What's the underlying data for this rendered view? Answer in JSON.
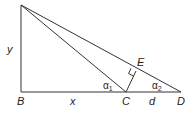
{
  "diagram": {
    "type": "geometry",
    "points": {
      "A": {
        "x": 21,
        "y": 5,
        "label": ""
      },
      "B": {
        "x": 21,
        "y": 92,
        "label": "B"
      },
      "C": {
        "x": 126,
        "y": 92,
        "label": "C"
      },
      "D": {
        "x": 181,
        "y": 92,
        "label": "D"
      },
      "E": {
        "x": 136,
        "y": 71,
        "label": "E"
      }
    },
    "labels": {
      "y": "y",
      "x": "x",
      "d": "d",
      "B": "B",
      "C": "C",
      "D": "D",
      "E": "E",
      "alpha1": "α",
      "alpha1_sub": "1",
      "alpha2": "α",
      "alpha2_sub": "2"
    },
    "segments": [
      "AB",
      "BD",
      "AC",
      "AD",
      "CE"
    ],
    "right_angle_marker": "E"
  }
}
